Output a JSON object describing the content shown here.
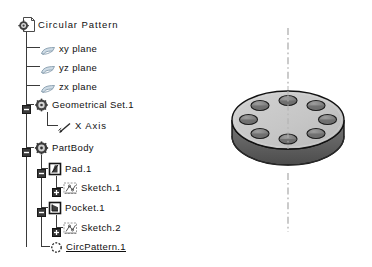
{
  "app": {
    "background_color": "#ffffff",
    "text_color": "#101010"
  },
  "tree": {
    "name": "specification-tree",
    "items": [
      {
        "label": "Circular Pattern",
        "icon": "document-gear-icon",
        "depth": 0,
        "expander": "none",
        "selected": false
      },
      {
        "label": "xy plane",
        "icon": "plane-icon",
        "depth": 1,
        "expander": "none",
        "selected": false
      },
      {
        "label": "yz plane",
        "icon": "plane-icon",
        "depth": 1,
        "expander": "none",
        "selected": false
      },
      {
        "label": "zx plane",
        "icon": "plane-icon",
        "depth": 1,
        "expander": "none",
        "selected": false
      },
      {
        "label": "Geometrical Set.1",
        "icon": "geometrical-set-icon",
        "depth": 1,
        "expander": "minus",
        "selected": false
      },
      {
        "label": "X Axis",
        "icon": "axis-icon",
        "depth": 2,
        "expander": "none",
        "selected": false
      },
      {
        "label": "PartBody",
        "icon": "part-body-icon",
        "depth": 1,
        "expander": "minus",
        "selected": false
      },
      {
        "label": "Pad.1",
        "icon": "pad-icon",
        "depth": 2,
        "expander": "minus",
        "selected": false
      },
      {
        "label": "Sketch.1",
        "icon": "sketch-icon",
        "depth": 3,
        "expander": "plus",
        "selected": false
      },
      {
        "label": "Pocket.1",
        "icon": "pocket-icon",
        "depth": 2,
        "expander": "minus",
        "selected": false
      },
      {
        "label": "Sketch.2",
        "icon": "sketch-icon",
        "depth": 3,
        "expander": "plus",
        "selected": false
      },
      {
        "label": "CircPattern.1",
        "icon": "circular-pattern-icon",
        "depth": 2,
        "expander": "none",
        "selected": true
      }
    ]
  },
  "model": {
    "name": "cylindrical-disc-with-circular-pocket-pattern",
    "shape": "disc",
    "pocket_count": 8,
    "axis_line_style": "dash-dot",
    "colors": {
      "top_face": "#c9c9c9",
      "side_wall": "#6f6f6f",
      "side_wall_dark": "#4f4f4f",
      "pocket_fill": "#8d8d8d",
      "pocket_shadow": "#5a5a5a",
      "outline": "#1a1a1a",
      "axis": "#a8a8a8"
    }
  }
}
